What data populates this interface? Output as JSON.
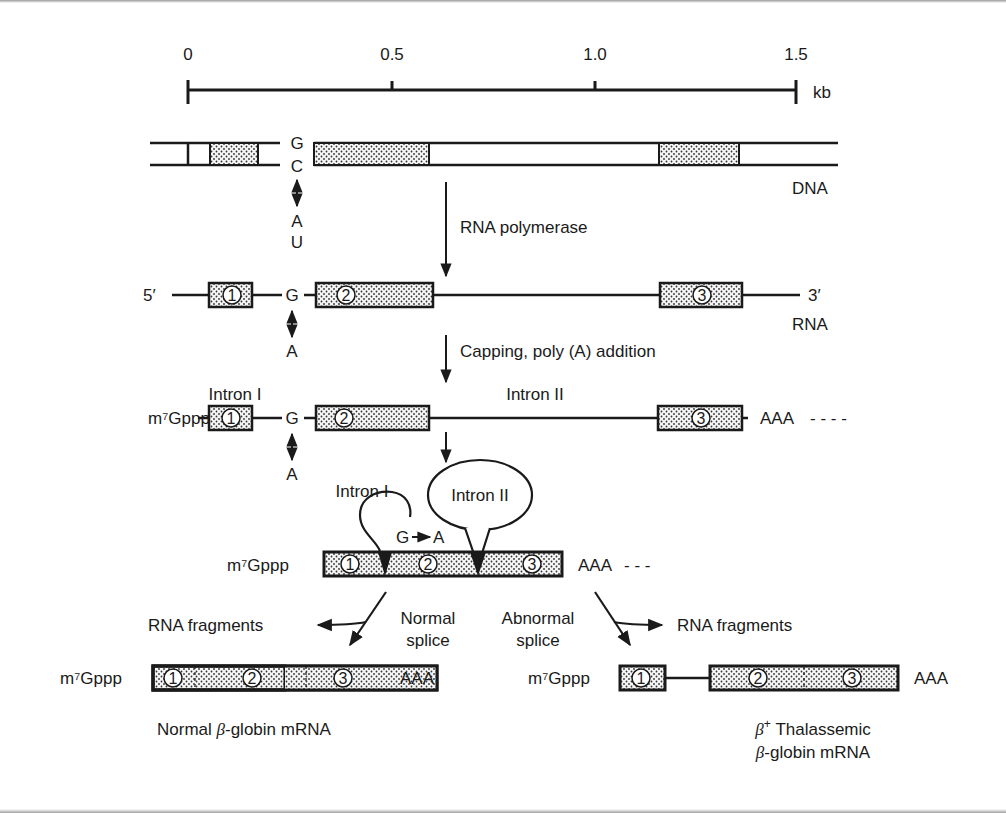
{
  "figure": {
    "colors": {
      "ink": "#1a1a1a",
      "background": "#ffffff",
      "exon_fill": "#f3f3f3"
    }
  },
  "scale": {
    "ticks": [
      "0",
      "0.5",
      "1.0",
      "1.5"
    ],
    "unit": "kb"
  },
  "dna": {
    "label": "DNA",
    "top_base": "G",
    "bottom_base": "C",
    "mutation_top": "A",
    "mutation_bottom": "U"
  },
  "step1": {
    "label": "RNA polymerase"
  },
  "rna": {
    "five_prime": "5′",
    "three_prime": "3′",
    "label": "RNA",
    "base": "G",
    "mutation": "A",
    "exons": [
      "1",
      "2",
      "3"
    ]
  },
  "step2": {
    "label": "Capping, poly (A) addition"
  },
  "capped": {
    "cap": "m⁷Gppp",
    "tail": "AAA",
    "tail_dashes": "- - - -",
    "base": "G",
    "mutation": "A",
    "intron1": "Intron I",
    "intron2": "Intron II",
    "exons": [
      "1",
      "2",
      "3"
    ]
  },
  "intermediate": {
    "cap": "m⁷Gppp",
    "tail": "AAA",
    "tail_dashes": "- - -",
    "intron1": "Intron I",
    "intron2": "Intron II",
    "mutation_from": "G",
    "mutation_to": "A",
    "exons": [
      "1",
      "2",
      "3"
    ]
  },
  "normal": {
    "path_label_line1": "Normal",
    "path_label_line2": "splice",
    "fragments": "RNA fragments",
    "cap": "m⁷Gppp",
    "tail": "AAA",
    "exons": [
      "1",
      "2",
      "3"
    ],
    "caption_prefix": "Normal ",
    "caption_beta": "β",
    "caption_suffix": "-globin mRNA"
  },
  "abnormal": {
    "path_label_line1": "Abnormal",
    "path_label_line2": "splice",
    "fragments": "RNA fragments",
    "cap": "m⁷Gppp",
    "tail": "AAA",
    "exons": [
      "1",
      "2",
      "3"
    ],
    "caption_line1_beta": "β",
    "caption_line1_sup": "+",
    "caption_line1_text": " Thalassemic",
    "caption_line2_beta": "β",
    "caption_line2_text": "-globin mRNA"
  }
}
